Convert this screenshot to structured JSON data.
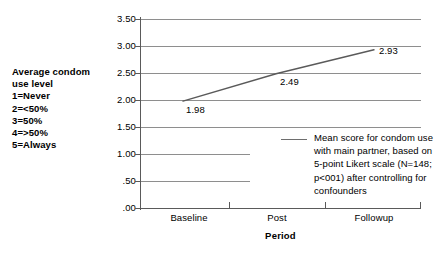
{
  "chart_data": {
    "type": "line",
    "title": "",
    "subtitle": "",
    "xlabel": "Period",
    "ylabel": "Average condom use level",
    "categories": [
      "Baseline",
      "Post",
      "Followup"
    ],
    "values": [
      1.98,
      2.49,
      2.93
    ],
    "point_labels": [
      "1.98",
      "2.49",
      "2.93"
    ],
    "ylim": [
      0.0,
      3.5
    ],
    "ytick_values": [
      3.5,
      3.0,
      2.5,
      2.0,
      1.5,
      1.0,
      0.5,
      0.0
    ],
    "ytick_labels": [
      "3.50",
      "3.00",
      "2.50",
      "2.00",
      "1.50",
      "1.00",
      ".50",
      ".00"
    ],
    "grid": "horizontal",
    "legend_position": "inside-right",
    "series": [
      {
        "name": "Mean score for condom use with main partner",
        "values": [
          1.98,
          2.49,
          2.93
        ]
      }
    ],
    "annotations": [
      "Average condom use level scale: 1=Never, 2=<50%, 3=50%, 4=>50%, 5=Always"
    ],
    "colors": {
      "line": "#5a5a5a",
      "gridline": "#8e8e8e",
      "axis": "#5a5a5a",
      "text": "#000000",
      "background": "#ffffff"
    }
  },
  "y_caption": {
    "heading": "Average condom\nuse level",
    "scale_lines": [
      "1=Never",
      "2=<50%",
      "3=50%",
      "4=>50%",
      "5=Always"
    ],
    "full_text": "Average condom\nuse level\n1=Never\n2=<50%\n3=50%\n4=>50%\n5=Always"
  },
  "axes": {
    "y_ticks": [
      {
        "label": "3.50"
      },
      {
        "label": "3.00"
      },
      {
        "label": "2.50"
      },
      {
        "label": "2.00"
      },
      {
        "label": "1.50"
      },
      {
        "label": "1.00"
      },
      {
        "label": ".50"
      },
      {
        "label": ".00"
      }
    ],
    "x_ticks": [
      {
        "label": "Baseline"
      },
      {
        "label": "Post"
      },
      {
        "label": "Followup"
      }
    ],
    "x_title": "Period"
  },
  "points": [
    {
      "label": "1.98"
    },
    {
      "label": "2.49"
    },
    {
      "label": "2.93"
    }
  ],
  "legend": {
    "entry_text": "Mean score for condom use with main partner, based on 5-point Likert scale (N=148; p<001) after controlling for confounders"
  }
}
